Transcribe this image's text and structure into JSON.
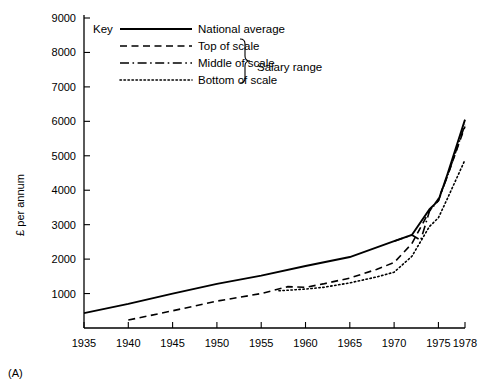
{
  "panel": {
    "label": "(A)"
  },
  "axes": {
    "ylabel": "£ per annum",
    "xlabel": "",
    "ytick_labels": [
      "1000",
      "2000",
      "3000",
      "4000",
      "5000",
      "6000",
      "7000",
      "8000",
      "9000"
    ],
    "xtick_labels": [
      "1935",
      "1940",
      "1945",
      "1950",
      "1955",
      "1960",
      "1965",
      "1970",
      "1975",
      "1978"
    ]
  },
  "legend": {
    "title": "Key",
    "bracket_label": "Salary range",
    "items": [
      {
        "label": "National average",
        "style": "solid"
      },
      {
        "label": "Top of scale",
        "style": "dashed"
      },
      {
        "label": "Middle of scale",
        "style": "dash-dot"
      },
      {
        "label": "Bottom of scale",
        "style": "dotted"
      }
    ]
  },
  "chart_data": {
    "type": "line",
    "title": "",
    "xlabel": "",
    "ylabel": "£ per annum",
    "xlim": [
      1935,
      1978
    ],
    "ylim": [
      0,
      9000
    ],
    "xticks": [
      1935,
      1940,
      1945,
      1950,
      1955,
      1960,
      1965,
      1970,
      1975,
      1978
    ],
    "yticks": [
      1000,
      2000,
      3000,
      4000,
      5000,
      6000,
      7000,
      8000,
      9000
    ],
    "grid": false,
    "legend_position": "top-left",
    "series": [
      {
        "name": "National average",
        "style": "solid",
        "x": [
          1935,
          1940,
          1945,
          1950,
          1955,
          1960,
          1965,
          1970,
          1972,
          1974,
          1975,
          1976,
          1978
        ],
        "values": [
          430,
          700,
          1000,
          1280,
          1520,
          1800,
          2060,
          2520,
          2700,
          3450,
          3700,
          4450,
          6050
        ]
      },
      {
        "name": "Top of scale",
        "style": "dashed",
        "x": [
          1940,
          1945,
          1950,
          1955,
          1958,
          1960,
          1962,
          1965,
          1968,
          1970,
          1972,
          1974,
          1975,
          1976,
          1978
        ],
        "values": [
          230,
          500,
          780,
          1000,
          1200,
          1180,
          1280,
          1450,
          1700,
          1900,
          2450,
          3400,
          3750,
          4400,
          5850
        ]
      },
      {
        "name": "Middle of scale",
        "style": "dash-dot",
        "x": [
          1970,
          1972,
          1973,
          1974,
          1975,
          1976,
          1978
        ],
        "values": [
          2520,
          2700,
          2550,
          3400,
          3700,
          4400,
          5900
        ]
      },
      {
        "name": "Bottom of scale",
        "style": "dotted",
        "x": [
          1957,
          1960,
          1962,
          1965,
          1968,
          1970,
          1972,
          1974,
          1975,
          1976,
          1978
        ],
        "values": [
          1080,
          1130,
          1180,
          1310,
          1480,
          1620,
          2080,
          2950,
          3200,
          3750,
          4880
        ]
      }
    ]
  }
}
